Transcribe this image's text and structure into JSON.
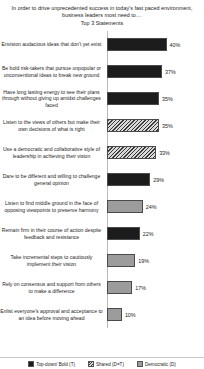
{
  "chart_data": {
    "type": "bar",
    "title": "In order to drive unprecedented success in today's fast paced environment, business leaders most need to....",
    "subtitle": "Top 3 Statements",
    "orientation": "horizontal",
    "xlabel": "",
    "ylabel": "",
    "xlim": [
      0,
      45
    ],
    "grid": false,
    "legend_position": "bottom",
    "categories": [
      "Envision audacious ideas that don't yet exist",
      "Be bold risk-takers  that pursue unpopular or unconventional ideas to break new ground",
      "Have long lasting energy to see their plans through without giving up amidst challenges faced",
      "Listen to the views of others but make their own decisions of what is right",
      "Use a democratic and collaborative style of leadership  in achieving their vision",
      "Dare to be different and willing to challenge  general opinion",
      "Listen to find middle ground in the face of opposing viewpoints  to preserve harmony",
      "Remain firm in their course of action despite feedback and resistance",
      "Take incremental steps to cautiously implement their vision",
      "Rely on consensus and support from others to make a difference",
      "Enlist everyone's approval and acceptance to an idea before moving ahead"
    ],
    "values": [
      40,
      37,
      35,
      35,
      33,
      29,
      24,
      22,
      19,
      17,
      10
    ],
    "value_labels": [
      "40%",
      "37%",
      "35%",
      "35%",
      "33%",
      "29%",
      "24%",
      "22%",
      "19%",
      "17%",
      "10%"
    ],
    "series_assignment": [
      "topdown",
      "topdown",
      "topdown",
      "shared",
      "shared",
      "topdown",
      "democratic",
      "topdown",
      "democratic",
      "democratic",
      "democratic"
    ],
    "legend": [
      {
        "key": "topdown",
        "label": "Top-down/ Bold (T)",
        "color": "#1c1c1c"
      },
      {
        "key": "shared",
        "label": "Shared (D=T)",
        "color": "#8a8a8a"
      },
      {
        "key": "democratic",
        "label": "Democratic (D)",
        "color": "#9c9c9c"
      }
    ]
  }
}
